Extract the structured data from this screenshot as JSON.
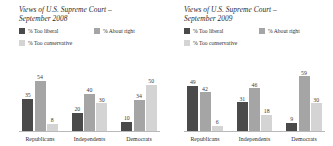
{
  "charts": [
    {
      "title_line1": "Views of U.S. Supreme Court –",
      "title_line2": "September 2008",
      "legend": [
        {
          "label": "% Too liberal",
          "color": "#4a4a4a"
        },
        {
          "label": "% About right",
          "color": "#a5a5a5"
        },
        {
          "label": "% Too conservative",
          "color": "#d4d4d4"
        }
      ],
      "chart_data": {
        "type": "bar",
        "title": "Views of U.S. Supreme Court – September 2008",
        "xlabel": "",
        "ylabel": "",
        "ylim": [
          0,
          60
        ],
        "grid": false,
        "legend_position": "top-left",
        "categories": [
          "Republicans",
          "Independents",
          "Democrats"
        ],
        "series": [
          {
            "name": "% Too liberal",
            "color": "#4a4a4a",
            "values": [
              35,
              20,
              10
            ]
          },
          {
            "name": "% About right",
            "color": "#a5a5a5",
            "values": [
              54,
              40,
              34
            ]
          },
          {
            "name": "% Too conservative",
            "color": "#d4d4d4",
            "values": [
              8,
              30,
              50
            ]
          }
        ]
      }
    },
    {
      "title_line1": "Views of U.S. Supreme Court –",
      "title_line2": "September 2009",
      "legend": [
        {
          "label": "% Too liberal",
          "color": "#4a4a4a"
        },
        {
          "label": "% About right",
          "color": "#a5a5a5"
        },
        {
          "label": "% Too conservative",
          "color": "#d4d4d4"
        }
      ],
      "chart_data": {
        "type": "bar",
        "title": "Views of U.S. Supreme Court – September 2009",
        "xlabel": "",
        "ylabel": "",
        "ylim": [
          0,
          60
        ],
        "grid": false,
        "legend_position": "top-left",
        "categories": [
          "Republicans",
          "Independents",
          "Democrats"
        ],
        "series": [
          {
            "name": "% Too liberal",
            "color": "#4a4a4a",
            "values": [
              49,
              31,
              9
            ]
          },
          {
            "name": "% About right",
            "color": "#a5a5a5",
            "values": [
              42,
              46,
              59
            ]
          },
          {
            "name": "% Too conservative",
            "color": "#d4d4d4",
            "values": [
              6,
              18,
              30
            ]
          }
        ]
      }
    }
  ]
}
